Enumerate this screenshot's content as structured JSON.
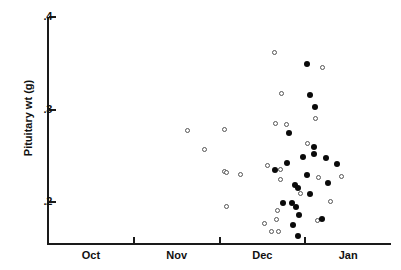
{
  "chart_data": {
    "type": "scatter",
    "title": "",
    "xlabel": "",
    "ylabel": "Pituitary wt (g)",
    "grid": false,
    "legend_position": "none",
    "x_categories": [
      "Oct",
      "Nov",
      "Dec",
      "Jan"
    ],
    "x_tick_labels": [
      "Oct",
      "Nov",
      "Dec",
      "Jan"
    ],
    "y_tick_labels": [
      ".4",
      ".3",
      ".2"
    ],
    "y_tick_values": [
      0.4,
      0.3,
      0.2
    ],
    "ylim": [
      0.155,
      0.4
    ],
    "xlim": [
      0,
      4
    ],
    "series": [
      {
        "name": "open-circles",
        "marker": "open-circle",
        "color": "#555555",
        "points": [
          {
            "month": "Nov",
            "x": 1.63,
            "y": 0.2775
          },
          {
            "month": "Nov",
            "x": 2.06,
            "y": 0.2787
          },
          {
            "month": "Nov",
            "x": 1.83,
            "y": 0.2575
          },
          {
            "month": "Nov",
            "x": 2.06,
            "y": 0.2337
          },
          {
            "month": "Nov",
            "x": 2.08,
            "y": 0.2325
          },
          {
            "month": "Nov",
            "x": 2.24,
            "y": 0.23
          },
          {
            "month": "Dec",
            "x": 2.56,
            "y": 0.24
          },
          {
            "month": "Nov",
            "x": 2.08,
            "y": 0.195
          },
          {
            "month": "Dec",
            "x": 2.53,
            "y": 0.1775
          },
          {
            "month": "Dec",
            "x": 2.68,
            "y": 0.1913
          },
          {
            "month": "Dec",
            "x": 2.66,
            "y": 0.1813
          },
          {
            "month": "Dec",
            "x": 2.61,
            "y": 0.1688
          },
          {
            "month": "Dec",
            "x": 2.69,
            "y": 0.1688
          },
          {
            "month": "Dec",
            "x": 2.64,
            "y": 0.3613
          },
          {
            "month": "Dec",
            "x": 2.72,
            "y": 0.3175
          },
          {
            "month": "Dec",
            "x": 2.65,
            "y": 0.285
          },
          {
            "month": "Dec",
            "x": 2.78,
            "y": 0.2838
          },
          {
            "month": "Dec",
            "x": 2.71,
            "y": 0.235
          },
          {
            "month": "Dec",
            "x": 2.71,
            "y": 0.225
          },
          {
            "month": "Dec",
            "x": 3.15,
            "y": 0.2263
          },
          {
            "month": "Jan",
            "x": 3.2,
            "y": 0.345
          },
          {
            "month": "Jan",
            "x": 3.12,
            "y": 0.29
          },
          {
            "month": "Jan",
            "x": 3.03,
            "y": 0.2638
          },
          {
            "month": "Jan",
            "x": 3.42,
            "y": 0.2275
          },
          {
            "month": "Jan",
            "x": 3.3,
            "y": 0.2013
          },
          {
            "month": "Jan",
            "x": 3.14,
            "y": 0.18
          },
          {
            "month": "Jan",
            "x": 2.95,
            "y": 0.21
          }
        ]
      },
      {
        "name": "filled-circles",
        "marker": "filled-circle",
        "color": "#0a0a0a",
        "points": [
          {
            "month": "Jan",
            "x": 3.02,
            "y": 0.3488
          },
          {
            "month": "Jan",
            "x": 3.05,
            "y": 0.3163
          },
          {
            "month": "Jan",
            "x": 3.11,
            "y": 0.3025
          },
          {
            "month": "Jan",
            "x": 2.81,
            "y": 0.275
          },
          {
            "month": "Jan",
            "x": 3.1,
            "y": 0.26
          },
          {
            "month": "Jan",
            "x": 3.1,
            "y": 0.2525
          },
          {
            "month": "Jan",
            "x": 2.97,
            "y": 0.2488
          },
          {
            "month": "Jan",
            "x": 3.24,
            "y": 0.2475
          },
          {
            "month": "Jan",
            "x": 2.65,
            "y": 0.235
          },
          {
            "month": "Jan",
            "x": 3.02,
            "y": 0.23
          },
          {
            "month": "Jan",
            "x": 3.27,
            "y": 0.2213
          },
          {
            "month": "Jan",
            "x": 2.88,
            "y": 0.2188
          },
          {
            "month": "Jan",
            "x": 2.91,
            "y": 0.215
          },
          {
            "month": "Jan",
            "x": 3.06,
            "y": 0.2088
          },
          {
            "month": "Jan",
            "x": 2.74,
            "y": 0.1988
          },
          {
            "month": "Jan",
            "x": 2.84,
            "y": 0.1988
          },
          {
            "month": "Jan",
            "x": 2.89,
            "y": 0.195
          },
          {
            "month": "Jan",
            "x": 2.93,
            "y": 0.1863
          },
          {
            "month": "Jan",
            "x": 3.19,
            "y": 0.1825
          },
          {
            "month": "Jan",
            "x": 2.86,
            "y": 0.175
          },
          {
            "month": "Jan",
            "x": 2.92,
            "y": 0.1638
          },
          {
            "month": "Jan",
            "x": 2.79,
            "y": 0.2425
          },
          {
            "month": "Jan",
            "x": 3.37,
            "y": 0.2413
          }
        ]
      }
    ]
  },
  "axes": {
    "y_title": "Pituitary wt (g)",
    "y_ticks": [
      {
        "label": ".4",
        "value": 0.4
      },
      {
        "label": ".3",
        "value": 0.3
      },
      {
        "label": ".2",
        "value": 0.2
      }
    ],
    "x_ticks": [
      {
        "label": "Oct",
        "center": 0.5
      },
      {
        "label": "Nov",
        "center": 1.5
      },
      {
        "label": "Dec",
        "center": 2.5
      },
      {
        "label": "Jan",
        "center": 3.5
      }
    ]
  }
}
